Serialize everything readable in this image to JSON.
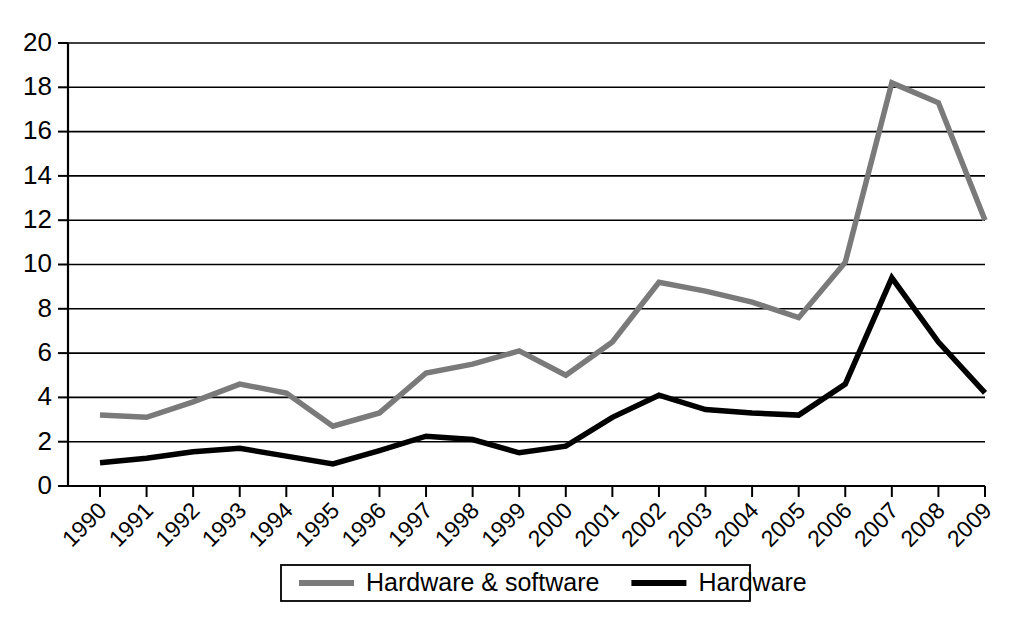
{
  "chart_data": {
    "type": "line",
    "title": "",
    "xlabel": "",
    "ylabel": "",
    "ylim": [
      0,
      20
    ],
    "ytick_step": 2,
    "grid": true,
    "legend_position": "bottom",
    "categories": [
      "1990",
      "1991",
      "1992",
      "1993",
      "1994",
      "1995",
      "1996",
      "1997",
      "1998",
      "1999",
      "2000",
      "2001",
      "2002",
      "2003",
      "2004",
      "2005",
      "2006",
      "2007",
      "2008",
      "2009"
    ],
    "yticks": [
      "0",
      "2",
      "4",
      "6",
      "8",
      "10",
      "12",
      "14",
      "16",
      "18",
      "20"
    ],
    "series": [
      {
        "name": "Hardware & software",
        "color": "#7a7a7a",
        "width": 5.5,
        "values": [
          3.2,
          3.1,
          3.8,
          4.6,
          4.2,
          2.7,
          3.3,
          5.1,
          5.5,
          6.1,
          5.0,
          6.5,
          9.2,
          8.8,
          8.3,
          7.6,
          10.1,
          18.2,
          17.3,
          12.0
        ]
      },
      {
        "name": "Hardware",
        "color": "#000000",
        "width": 5.5,
        "values": [
          1.05,
          1.25,
          1.55,
          1.7,
          1.35,
          1.0,
          1.6,
          2.25,
          2.1,
          1.5,
          1.8,
          3.1,
          4.1,
          3.45,
          3.3,
          3.2,
          4.6,
          9.4,
          6.5,
          4.2
        ]
      }
    ]
  },
  "legend": {
    "items": [
      {
        "label": "Hardware & software",
        "color": "#7a7a7a"
      },
      {
        "label": "Hardware",
        "color": "#000000"
      }
    ]
  }
}
